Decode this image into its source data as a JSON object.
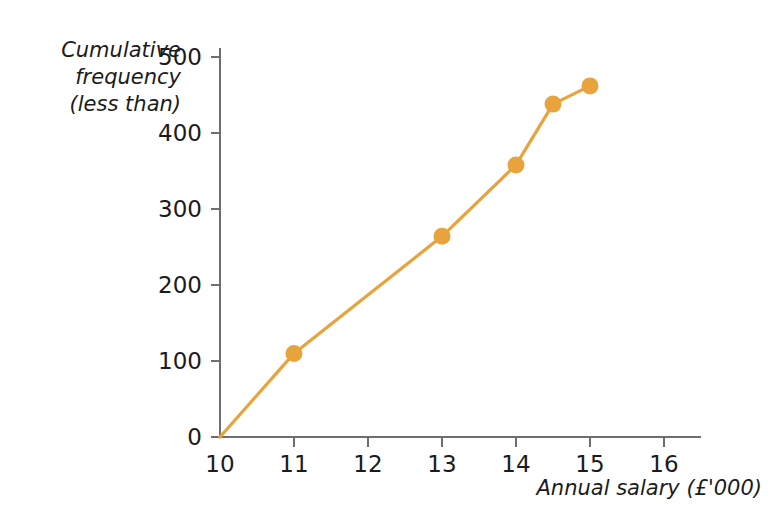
{
  "chart_data": {
    "type": "line",
    "title": "",
    "xlabel": "Annual salary (£'000)",
    "ylabel": "Cumulative frequency (less than)",
    "ylabel_lines": [
      "Cumulative",
      "frequency",
      "(less than)"
    ],
    "x": [
      10,
      11,
      13,
      14,
      14.5,
      15
    ],
    "values": [
      0,
      110,
      264,
      358,
      438,
      462
    ],
    "series": [
      {
        "name": "Cumulative frequency",
        "color": "#E8A33D",
        "points": [
          {
            "x": 10,
            "y": 0
          },
          {
            "x": 11,
            "y": 110
          },
          {
            "x": 13,
            "y": 264
          },
          {
            "x": 14,
            "y": 358
          },
          {
            "x": 14.5,
            "y": 438
          },
          {
            "x": 15,
            "y": 462
          }
        ]
      }
    ],
    "markers": [
      {
        "x": 11,
        "y": 110
      },
      {
        "x": 13,
        "y": 264
      },
      {
        "x": 14,
        "y": 358
      },
      {
        "x": 14.5,
        "y": 438
      },
      {
        "x": 15,
        "y": 462
      }
    ],
    "xlim": [
      10,
      16.5
    ],
    "ylim": [
      0,
      520
    ],
    "xticks": [
      10,
      11,
      12,
      13,
      14,
      15,
      16
    ],
    "xtick_labels": [
      "10",
      "11",
      "12",
      "13",
      "14",
      "15",
      "16"
    ],
    "yticks": [
      0,
      100,
      200,
      300,
      400,
      500
    ],
    "ytick_labels": [
      "0",
      "100",
      "200",
      "300",
      "400",
      "500"
    ],
    "grid": false,
    "legend": "none",
    "accent_color": "#E8A33D",
    "axis_color": "#6E6E6E",
    "text_color": "#1B1B1B",
    "background": "#FFFFFF"
  }
}
